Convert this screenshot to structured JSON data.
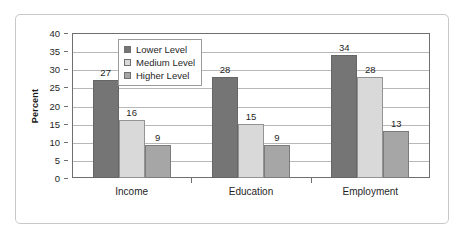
{
  "chart_data": {
    "type": "bar",
    "title": "",
    "xlabel": "",
    "ylabel": "Percent",
    "ylim": [
      0,
      40
    ],
    "ytick_step": 5,
    "yticks": [
      "40",
      "35",
      "30",
      "25",
      "20",
      "15",
      "10",
      "5",
      "0"
    ],
    "grid": true,
    "legend_position": "top-left-inside",
    "categories": [
      "Income",
      "Education",
      "Employment"
    ],
    "series": [
      {
        "name": "Lower Level",
        "color": "#757575",
        "values": [
          27,
          28,
          34
        ]
      },
      {
        "name": "Medium Level",
        "color": "#d9d9d9",
        "values": [
          16,
          15,
          28
        ]
      },
      {
        "name": "Higher Level",
        "color": "#a6a6a6",
        "values": [
          9,
          9,
          13
        ]
      }
    ],
    "data_labels": {
      "Income": [
        "27",
        "16",
        "9"
      ],
      "Education": [
        "28",
        "15",
        "9"
      ],
      "Employment": [
        "34",
        "28",
        "13"
      ]
    }
  },
  "legend": {
    "items": [
      {
        "label": "Lower Level"
      },
      {
        "label": "Medium Level"
      },
      {
        "label": "Higher Level"
      }
    ]
  },
  "axes": {
    "y_title": "Percent"
  }
}
